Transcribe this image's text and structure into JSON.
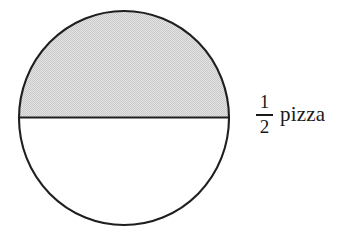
{
  "figure": {
    "type": "fraction-circle-diagram",
    "subject": "pizza",
    "shape": "circle",
    "total_parts": 2,
    "shaded_parts": 1,
    "background_color": "#ffffff",
    "outline_color": "#1a1a1a",
    "shaded_fill_color": "#d8d8d8",
    "unshaded_fill_color": "#ffffff",
    "divider": {
      "name": "diameter-line",
      "orientation": "horizontal",
      "color": "#1a1a1a"
    },
    "circle": {
      "center_x": 124,
      "center_y": 118,
      "radius_x": 106,
      "radius_y": 108,
      "stroke_width": 2
    }
  },
  "label": {
    "fraction": {
      "numerator": "1",
      "denominator": "2"
    },
    "unit": "pizza",
    "full_text": "1/2 pizza"
  }
}
